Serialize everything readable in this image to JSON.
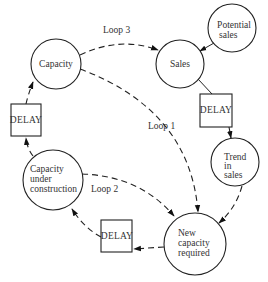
{
  "diagram": {
    "type": "causal-loop",
    "nodes": [
      {
        "id": "capacity",
        "shape": "circle",
        "lines": [
          "Capacity"
        ]
      },
      {
        "id": "sales",
        "shape": "circle",
        "lines": [
          "Sales"
        ]
      },
      {
        "id": "potential_sales",
        "shape": "circle",
        "lines": [
          "Potential",
          "sales"
        ]
      },
      {
        "id": "delay_right",
        "shape": "box",
        "lines": [
          "DELAY"
        ]
      },
      {
        "id": "trend_in_sales",
        "shape": "circle",
        "lines": [
          "Trend",
          "in",
          "sales"
        ]
      },
      {
        "id": "new_capacity_required",
        "shape": "circle",
        "lines": [
          "New",
          "capacity",
          "required"
        ]
      },
      {
        "id": "delay_bottom",
        "shape": "box",
        "lines": [
          "DELAY"
        ]
      },
      {
        "id": "capacity_under_construction",
        "shape": "circle",
        "lines": [
          "Capacity",
          "under",
          "construction"
        ]
      },
      {
        "id": "delay_left",
        "shape": "box",
        "lines": [
          "DELAY"
        ]
      }
    ],
    "edges": [
      {
        "from": "capacity",
        "to": "sales",
        "style": "dashed",
        "label": "Loop 3"
      },
      {
        "from": "potential_sales",
        "to": "sales",
        "style": "solid"
      },
      {
        "from": "sales",
        "to": "delay_right",
        "style": "solid"
      },
      {
        "from": "delay_right",
        "to": "trend_in_sales",
        "style": "dashed"
      },
      {
        "from": "trend_in_sales",
        "to": "new_capacity_required",
        "style": "dashed"
      },
      {
        "from": "capacity",
        "to": "new_capacity_required",
        "style": "dashed",
        "label": "Loop 1"
      },
      {
        "from": "capacity_under_construction",
        "to": "new_capacity_required",
        "style": "dashed",
        "label": "Loop 2"
      },
      {
        "from": "new_capacity_required",
        "to": "delay_bottom",
        "style": "dashed"
      },
      {
        "from": "delay_bottom",
        "to": "capacity_under_construction",
        "style": "dashed"
      },
      {
        "from": "capacity_under_construction",
        "to": "delay_left",
        "style": "dashed"
      },
      {
        "from": "delay_left",
        "to": "capacity",
        "style": "dashed"
      }
    ],
    "loop_labels": {
      "loop1": "Loop 1",
      "loop2": "Loop 2",
      "loop3": "Loop 3"
    }
  }
}
